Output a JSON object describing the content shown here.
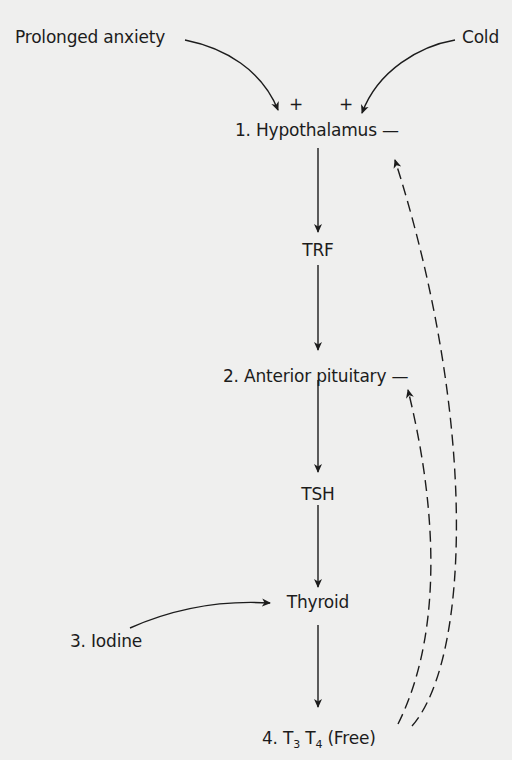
{
  "stimuli": {
    "left": "Prolonged anxiety",
    "right": "Cold",
    "left_sign": "+",
    "right_sign": "+"
  },
  "nodes": [
    {
      "id": "hypothalamus",
      "label": "1. Hypothalamus —"
    },
    {
      "id": "trf",
      "label": "TRF"
    },
    {
      "id": "anterior_pituitary",
      "label": "2. Anterior pituitary —"
    },
    {
      "id": "tsh",
      "label": "TSH"
    },
    {
      "id": "thyroid",
      "label": "Thyroid"
    },
    {
      "id": "iodine",
      "label": "3. Iodine"
    },
    {
      "id": "free_hormones",
      "label_prefix": "4. T",
      "sub1": "3",
      "mid": " T",
      "sub2": "4",
      "suffix": " (Free)"
    }
  ],
  "edges": [
    {
      "from": "Prolonged anxiety",
      "to": "hypothalamus",
      "style": "solid",
      "sign": "+"
    },
    {
      "from": "Cold",
      "to": "hypothalamus",
      "style": "solid",
      "sign": "+"
    },
    {
      "from": "hypothalamus",
      "to": "trf",
      "style": "solid"
    },
    {
      "from": "trf",
      "to": "anterior_pituitary",
      "style": "solid"
    },
    {
      "from": "anterior_pituitary",
      "to": "tsh",
      "style": "solid"
    },
    {
      "from": "tsh",
      "to": "thyroid",
      "style": "solid"
    },
    {
      "from": "iodine",
      "to": "thyroid",
      "style": "solid"
    },
    {
      "from": "thyroid",
      "to": "free_hormones",
      "style": "solid"
    },
    {
      "from": "free_hormones",
      "to": "hypothalamus",
      "style": "dashed",
      "meaning": "negative feedback"
    },
    {
      "from": "free_hormones",
      "to": "anterior_pituitary",
      "style": "dashed",
      "meaning": "negative feedback"
    }
  ],
  "colors": {
    "background": "#efefee",
    "ink": "#1c1c1c"
  }
}
